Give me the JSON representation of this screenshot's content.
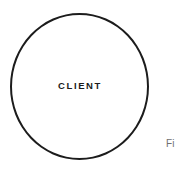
{
  "page": {
    "background_color": "#ffffff",
    "width": 177,
    "height": 174
  },
  "diagram": {
    "type": "node-diagram",
    "nodes": [
      {
        "id": "client",
        "shape": "circle",
        "label": "CLIENT",
        "stroke_color": "#1c1c1c",
        "fill_color": "#ffffff",
        "stroke_width": 2
      }
    ]
  },
  "caption": {
    "text": "Fi",
    "color": "#6f6f6f",
    "truncated": true
  }
}
